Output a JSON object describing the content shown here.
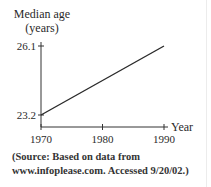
{
  "chart_data": {
    "type": "line",
    "title": "",
    "ylabel": "Median age (years)",
    "ylabel_lines": [
      "Median age",
      "(years)"
    ],
    "xlabel": "Year",
    "x": [
      1970,
      1990
    ],
    "series": [
      {
        "name": "Median age",
        "values": [
          23.2,
          26.1
        ]
      }
    ],
    "x_ticks": [
      1970,
      1980,
      1990
    ],
    "x_tick_labels": [
      "1970",
      "1980",
      "1990"
    ],
    "y_ticks": [
      23.2,
      26.1
    ],
    "y_tick_labels": [
      "23.2",
      "26.1"
    ],
    "xlim": [
      1970,
      1990
    ],
    "grid": false,
    "legend": "none"
  },
  "source_lines": [
    "(Source: Based on data from",
    "www.infoplease.com. Accessed 9/20/02.)"
  ],
  "colors": {
    "line": "#2a2a2a",
    "text": "#2a2a2a"
  }
}
